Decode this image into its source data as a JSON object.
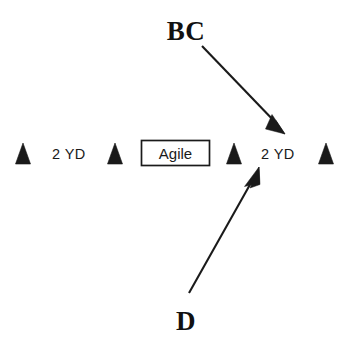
{
  "diagram": {
    "background_color": "#ffffff",
    "ink_color": "#1a1a1a",
    "width": 350,
    "height": 348,
    "cones": [
      {
        "id": "cone-1",
        "x": 23,
        "y": 164,
        "half_width": 7.5,
        "height": 21
      },
      {
        "id": "cone-2",
        "x": 115,
        "y": 164,
        "half_width": 7.5,
        "height": 21
      },
      {
        "id": "cone-3",
        "x": 234,
        "y": 164,
        "half_width": 7.5,
        "height": 21
      },
      {
        "id": "cone-4",
        "x": 326,
        "y": 164,
        "half_width": 7.5,
        "height": 21
      }
    ],
    "distance_labels": [
      {
        "id": "distance-left",
        "text": "2 YD",
        "x": 52,
        "y": 159
      },
      {
        "id": "distance-right",
        "text": "2 YD",
        "x": 261,
        "y": 159
      }
    ],
    "zone": {
      "label": "Agile",
      "box": {
        "x": 141,
        "y": 140,
        "width": 69,
        "height": 26
      },
      "label_x": 175,
      "label_y": 159
    },
    "routes": [
      {
        "id": "route-bc",
        "label": "BC",
        "label_x": 186,
        "label_y": 40,
        "shaft": {
          "x1": 202,
          "y1": 46,
          "x2": 278,
          "y2": 124
        },
        "head": {
          "tip_x": 284,
          "tip_y": 133,
          "angle_deg": 45
        },
        "direction": "down-right"
      },
      {
        "id": "route-d",
        "label": "D",
        "label_x": 186,
        "label_y": 330,
        "shaft": {
          "x1": 189,
          "y1": 293,
          "x2": 253,
          "y2": 180
        },
        "head": {
          "tip_x": 259,
          "tip_y": 167,
          "angle_deg": -60
        },
        "direction": "up-right"
      }
    ]
  }
}
